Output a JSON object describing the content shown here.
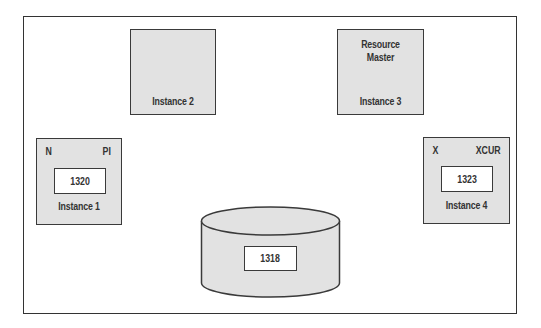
{
  "diagram": {
    "type": "RAC cache fusion block state diagram",
    "instances": [
      {
        "id": "instance-1",
        "label": "Instance 1",
        "mode": "N",
        "role": "PI",
        "scn": "1320"
      },
      {
        "id": "instance-2",
        "label": "Instance 2"
      },
      {
        "id": "instance-3",
        "label": "Instance 3",
        "title_line1": "Resource",
        "title_line2": "Master"
      },
      {
        "id": "instance-4",
        "label": "Instance 4",
        "mode": "X",
        "role": "XCUR",
        "scn": "1323"
      }
    ],
    "disk": {
      "label": "database-disk",
      "scn": "1318"
    },
    "colors": {
      "fill": "#e2e2e2",
      "stroke": "#3a3a3a",
      "text": "#333333",
      "background": "#ffffff"
    }
  }
}
